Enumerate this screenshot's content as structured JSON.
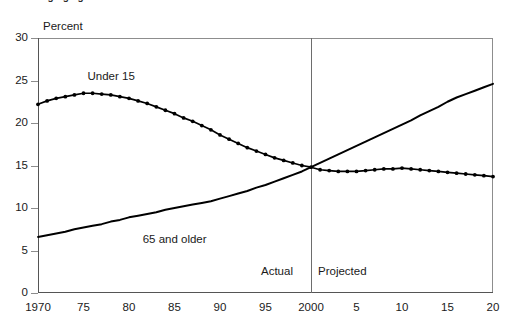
{
  "figure": {
    "title": "Changing age structure",
    "y_axis_title": "Percent"
  },
  "annotations": {
    "actual": "Actual",
    "projected": "Projected",
    "series_under15": "Under 15",
    "series_65plus": "65 and older"
  },
  "chart_data": {
    "type": "line",
    "title": "Changing age structure",
    "xlabel": "",
    "ylabel": "Percent",
    "ylim": [
      0,
      30
    ],
    "xlim": [
      1970,
      2020
    ],
    "yticks": [
      0,
      5,
      10,
      15,
      20,
      25,
      30
    ],
    "xticks": [
      1970,
      1975,
      1980,
      1985,
      1990,
      1995,
      2000,
      2005,
      2010,
      2015,
      2020
    ],
    "xticklabels": [
      "1970",
      "75",
      "80",
      "85",
      "90",
      "95",
      "2000",
      "5",
      "10",
      "15",
      "20"
    ],
    "grid": false,
    "legend": "inline-labels",
    "divider_x": 2000,
    "divider_labels": [
      "Actual",
      "Projected"
    ],
    "x": [
      1970,
      1971,
      1972,
      1973,
      1974,
      1975,
      1976,
      1977,
      1978,
      1979,
      1980,
      1981,
      1982,
      1983,
      1984,
      1985,
      1986,
      1987,
      1988,
      1989,
      1990,
      1991,
      1992,
      1993,
      1994,
      1995,
      1996,
      1997,
      1998,
      1999,
      2000,
      2001,
      2002,
      2003,
      2004,
      2005,
      2006,
      2007,
      2008,
      2009,
      2010,
      2011,
      2012,
      2013,
      2014,
      2015,
      2016,
      2017,
      2018,
      2019,
      2020
    ],
    "series": [
      {
        "name": "Under 15",
        "markers": true,
        "values": [
          22.2,
          22.6,
          22.9,
          23.1,
          23.3,
          23.5,
          23.5,
          23.4,
          23.3,
          23.1,
          22.9,
          22.6,
          22.3,
          21.9,
          21.5,
          21.1,
          20.6,
          20.2,
          19.7,
          19.2,
          18.6,
          18.1,
          17.6,
          17.1,
          16.7,
          16.3,
          15.9,
          15.6,
          15.3,
          15.0,
          14.8,
          14.5,
          14.4,
          14.3,
          14.3,
          14.3,
          14.4,
          14.5,
          14.6,
          14.6,
          14.7,
          14.6,
          14.5,
          14.4,
          14.3,
          14.2,
          14.1,
          14.0,
          13.9,
          13.8,
          13.7
        ]
      },
      {
        "name": "65 and older",
        "markers": false,
        "values": [
          6.6,
          6.8,
          7.0,
          7.2,
          7.5,
          7.7,
          7.9,
          8.1,
          8.4,
          8.6,
          8.9,
          9.1,
          9.3,
          9.5,
          9.8,
          10.0,
          10.2,
          10.4,
          10.6,
          10.8,
          11.1,
          11.4,
          11.7,
          12.0,
          12.4,
          12.7,
          13.1,
          13.5,
          13.9,
          14.3,
          14.8,
          15.3,
          15.8,
          16.3,
          16.8,
          17.3,
          17.8,
          18.3,
          18.8,
          19.3,
          19.8,
          20.3,
          20.9,
          21.4,
          21.9,
          22.5,
          23.0,
          23.4,
          23.8,
          24.2,
          24.6
        ]
      }
    ]
  }
}
